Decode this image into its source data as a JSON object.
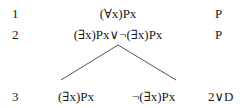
{
  "tree": {
    "lines": [
      {
        "number": "1",
        "formula": "(∀x)Px",
        "justification": "P"
      },
      {
        "number": "2",
        "formula": "(∃x)Px∨¬(∃x)Px",
        "justification": "P"
      }
    ],
    "branch_line": {
      "number": "3",
      "left_formula": "(∃x)Px",
      "right_formula": "¬(∃x)Px",
      "justification": "2∨D"
    },
    "line_color": "#555555"
  }
}
